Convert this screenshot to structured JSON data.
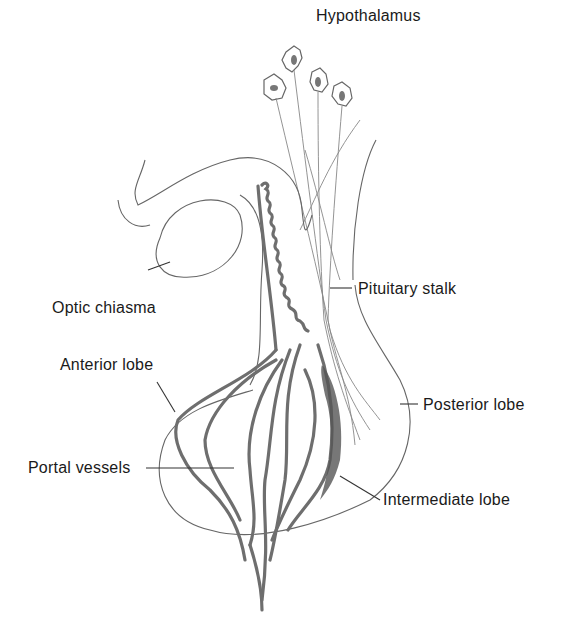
{
  "diagram": {
    "labels": {
      "hypothalamus": "Hypothalamus",
      "optic_chiasma": "Optic chiasma",
      "pituitary_stalk": "Pituitary stalk",
      "anterior_lobe": "Anterior lobe",
      "posterior_lobe": "Posterior lobe",
      "portal_vessels": "Portal vessels",
      "intermediate_lobe": "Intermediate lobe"
    },
    "colors": {
      "outline": "#555555",
      "vessels": "#6e6e6e",
      "intermediate_shading": "#444444",
      "text": "#1a1a1a"
    }
  }
}
